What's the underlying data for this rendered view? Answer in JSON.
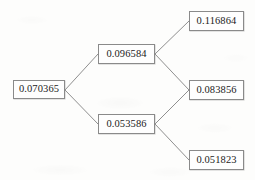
{
  "diagram": {
    "type": "binomial-lattice",
    "title": "",
    "steps": 2,
    "recombining": true,
    "node_count": 6,
    "edge_count": 6,
    "style": {
      "background": "#fdfdfc",
      "node_border": "#8a8a8a",
      "node_fill": "#fefefe",
      "edge_color": "#8f8f8f",
      "text_color": "#1b1b1b"
    },
    "nodes": [
      {
        "id": "n0",
        "label": "0.070365",
        "step": 0,
        "level": 0,
        "x": 13,
        "y": 80,
        "w": 52,
        "h": 19
      },
      {
        "id": "n1u",
        "label": "0.096584",
        "step": 1,
        "level": 1,
        "x": 98,
        "y": 44,
        "w": 57,
        "h": 20
      },
      {
        "id": "n1d",
        "label": "0.053586",
        "step": 1,
        "level": 0,
        "x": 98,
        "y": 114,
        "w": 57,
        "h": 20
      },
      {
        "id": "n2uu",
        "label": "0.116864",
        "step": 2,
        "level": 2,
        "x": 189,
        "y": 11,
        "w": 55,
        "h": 20
      },
      {
        "id": "n2ud",
        "label": "0.083856",
        "step": 2,
        "level": 1,
        "x": 189,
        "y": 80,
        "w": 55,
        "h": 20
      },
      {
        "id": "n2dd",
        "label": "0.051823",
        "step": 2,
        "level": 0,
        "x": 189,
        "y": 150,
        "w": 55,
        "h": 20
      }
    ],
    "edges": [
      {
        "from": "n0",
        "to": "n1u",
        "direction": "up",
        "x1": 65,
        "y1": 90,
        "x2": 98,
        "y2": 54
      },
      {
        "from": "n0",
        "to": "n1d",
        "direction": "down",
        "x1": 65,
        "y1": 90,
        "x2": 98,
        "y2": 124
      },
      {
        "from": "n1u",
        "to": "n2uu",
        "direction": "up",
        "x1": 155,
        "y1": 54,
        "x2": 189,
        "y2": 21
      },
      {
        "from": "n1u",
        "to": "n2ud",
        "direction": "down",
        "x1": 155,
        "y1": 54,
        "x2": 189,
        "y2": 90
      },
      {
        "from": "n1d",
        "to": "n2ud",
        "direction": "up",
        "x1": 155,
        "y1": 124,
        "x2": 189,
        "y2": 90
      },
      {
        "from": "n1d",
        "to": "n2dd",
        "direction": "down",
        "x1": 155,
        "y1": 124,
        "x2": 189,
        "y2": 160
      }
    ]
  },
  "chart_data": {
    "type": "diagram",
    "subtype": "binomial-tree",
    "title": "",
    "xlabel": "",
    "ylabel": "",
    "steps": [
      0,
      1,
      2
    ],
    "values_by_step": [
      [
        0.070365
      ],
      [
        0.096584,
        0.053586
      ],
      [
        0.116864,
        0.083856,
        0.051823
      ]
    ],
    "labels_by_step": [
      [
        "0.070365"
      ],
      [
        "0.096584",
        "0.053586"
      ],
      [
        "0.116864",
        "0.083856",
        "0.051823"
      ]
    ],
    "root_value": 0.070365,
    "terminal_values": [
      0.116864,
      0.083856,
      0.051823
    ],
    "up_factor": 1.3726,
    "down_factor": 0.7615,
    "grid": false,
    "legend": "none"
  }
}
